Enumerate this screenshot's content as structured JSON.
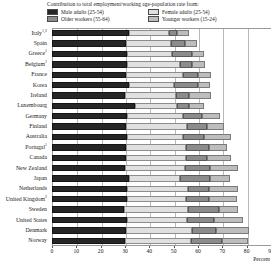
{
  "legend": {
    "title": "Contribution to total employment/working age-population rate from:",
    "items": [
      {
        "key": "male",
        "label": "Male adults (25-54)",
        "color": "#262626"
      },
      {
        "key": "female",
        "label": "Female adults (25-54)",
        "color": "#e0e0e0"
      },
      {
        "key": "older",
        "label": "Older workers (55-64)",
        "color": "#8c8c8c"
      },
      {
        "key": "younger",
        "label": "Younger workers (15-24)",
        "color": "#bdbdbd"
      }
    ]
  },
  "axis": {
    "title": "Percent",
    "ticks": [
      "0",
      "10",
      "20",
      "30",
      "40",
      "50",
      "60",
      "70",
      "80",
      "90"
    ]
  },
  "chart_data": {
    "type": "bar",
    "title": "Contribution to total employment/working age-population rate from:",
    "xlabel": "Percent",
    "ylabel": "",
    "xlim": [
      0,
      90
    ],
    "grid": true,
    "orientation": "horizontal",
    "stacked": true,
    "legend_position": "top",
    "categories": [
      "Italy",
      "Spain",
      "Greece",
      "Belgium",
      "France",
      "Korea",
      "Ireland",
      "Luxembourg",
      "Germany",
      "Finland",
      "Australia",
      "Portugal",
      "Canada",
      "New Zealand",
      "Japan",
      "Netherlands",
      "United Kingdom",
      "Sweden",
      "United States",
      "Denmark",
      "Norway"
    ],
    "category_footnotes": {
      "Italy": "1,2",
      "Greece": "1",
      "Belgium": "1",
      "Portugal": "1",
      "United Kingdom": "2"
    },
    "series": [
      {
        "name": "Male adults (25-54)",
        "color": "#262626",
        "values": [
          31.5,
          30.5,
          31.0,
          31.0,
          30.5,
          31.5,
          30.0,
          34.0,
          31.0,
          30.5,
          31.0,
          30.5,
          30.5,
          30.0,
          31.5,
          31.0,
          31.0,
          29.5,
          31.0,
          30.5,
          30.0
        ]
      },
      {
        "name": "Female adults (25-54)",
        "color": "#e0e0e0",
        "values": [
          16.5,
          18.5,
          18.5,
          21.5,
          23.5,
          18.5,
          21.0,
          17.5,
          23.0,
          25.0,
          23.0,
          24.5,
          24.5,
          24.5,
          21.0,
          25.0,
          24.0,
          26.5,
          24.5,
          27.0,
          27.0
        ]
      },
      {
        "name": "Older workers (55-64)",
        "color": "#8c8c8c",
        "values": [
          3.5,
          5.5,
          8.0,
          5.0,
          6.0,
          10.0,
          5.5,
          5.0,
          7.5,
          8.0,
          8.5,
          9.5,
          8.5,
          10.5,
          12.5,
          8.5,
          9.5,
          12.5,
          11.0,
          10.0,
          13.0
        ]
      },
      {
        "name": "Younger workers (15-24)",
        "color": "#bdbdbd",
        "values": [
          5.0,
          5.0,
          5.0,
          5.5,
          5.5,
          5.0,
          9.0,
          6.0,
          7.5,
          7.0,
          11.0,
          7.5,
          10.0,
          11.5,
          8.0,
          12.0,
          11.5,
          8.0,
          12.0,
          13.5,
          10.5
        ]
      }
    ],
    "totals": [
      56.5,
      59.5,
      62.5,
      63.0,
      65.5,
      65.0,
      65.5,
      62.5,
      69.0,
      70.5,
      73.5,
      72.0,
      73.5,
      76.5,
      73.0,
      76.5,
      76.0,
      76.5,
      78.5,
      81.0,
      80.5
    ]
  }
}
